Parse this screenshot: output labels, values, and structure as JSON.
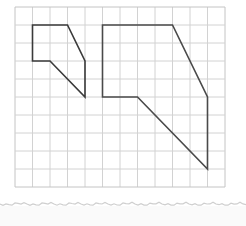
{
  "diagram": {
    "type": "grid-polygons",
    "grid": {
      "columns": 12,
      "rows": 10,
      "origin_px": [
        15,
        7
      ],
      "cell_w_px": 17.5,
      "cell_h_px": 18,
      "line_color": "#d2d2d2",
      "border_color": "#c4c4c4"
    },
    "shapes": [
      {
        "name": "small-polygon",
        "stroke": "#3a3a3a",
        "vertices": [
          [
            1,
            1
          ],
          [
            3,
            1
          ],
          [
            4,
            3
          ],
          [
            4,
            5
          ],
          [
            2,
            3
          ],
          [
            1,
            3
          ]
        ]
      },
      {
        "name": "large-polygon",
        "stroke": "#4a4a4a",
        "vertices": [
          [
            5,
            1
          ],
          [
            9,
            1
          ],
          [
            11,
            5
          ],
          [
            11,
            9
          ],
          [
            7,
            5
          ],
          [
            5,
            5
          ]
        ]
      }
    ],
    "paper_edge_y_px": 204,
    "background": "#ffffff"
  }
}
